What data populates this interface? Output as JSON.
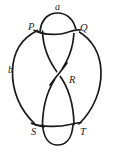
{
  "figure": {
    "kind": "knot-diagram",
    "width": 114,
    "height": 153,
    "background_color": "#ffffff",
    "stroke_color": "#1a1a1a"
  },
  "labels": {
    "a": "a",
    "b": "b",
    "P": "P",
    "Q": "Q",
    "R": "R",
    "S": "S",
    "T": "T"
  },
  "label_positions": {
    "a": {
      "x": 56,
      "y": 5
    },
    "b": {
      "x": 11,
      "y": 70
    },
    "P": {
      "x": 30,
      "y": 25
    },
    "Q": {
      "x": 79,
      "y": 26
    },
    "R": {
      "x": 70,
      "y": 78
    },
    "S": {
      "x": 33,
      "y": 129
    },
    "T": {
      "x": 80,
      "y": 129
    }
  },
  "crossings": [
    {
      "name": "P",
      "label": "P"
    },
    {
      "name": "Q",
      "label": "Q"
    },
    {
      "name": "R",
      "label": "R"
    },
    {
      "name": "S",
      "label": "S"
    },
    {
      "name": "T",
      "label": "T"
    }
  ],
  "arcs": [
    {
      "name": "a",
      "label": "a",
      "description": "top small arc joining P and Q"
    },
    {
      "name": "b",
      "label": "b",
      "description": "left outer arc"
    }
  ]
}
